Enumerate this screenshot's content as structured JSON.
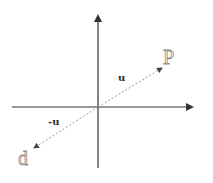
{
  "diagram": {
    "type": "vector-reflection",
    "colors": {
      "axis": "#333333",
      "dashed_vector": "#9a9a9a",
      "point_label": "#8a8a8a",
      "vector_label": "#2a2a2a"
    },
    "axes": {
      "origin": [
        98,
        107
      ],
      "x_axis": {
        "from": [
          12,
          107
        ],
        "to": [
          194,
          107
        ]
      },
      "y_axis": {
        "from": [
          98,
          168
        ],
        "to": [
          98,
          14
        ]
      }
    },
    "vectors": [
      {
        "name": "u",
        "label": "u",
        "from": [
          98,
          107
        ],
        "to": [
          162,
          68
        ]
      },
      {
        "name": "neg-u",
        "label": "-u",
        "from": [
          98,
          107
        ],
        "to": [
          34,
          148
        ]
      }
    ],
    "points": [
      {
        "name": "p",
        "label": "P"
      },
      {
        "name": "d",
        "label": "d"
      }
    ]
  }
}
